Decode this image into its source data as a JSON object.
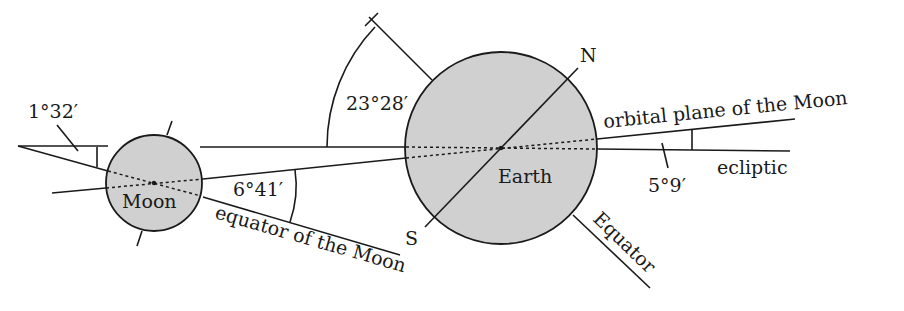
{
  "diagram": {
    "colors": {
      "background": "#ffffff",
      "stroke": "#1a1a1a",
      "body_fill": "#d0d0d0"
    },
    "bodies": {
      "earth": {
        "label": "Earth"
      },
      "moon": {
        "label": "Moon"
      }
    },
    "poles": {
      "north": "N",
      "south": "S"
    },
    "lines": {
      "orbital_plane": "orbital plane of the Moon",
      "ecliptic": "ecliptic",
      "equator_of_moon": "equator of the Moon",
      "earth_equator": "Equator"
    },
    "angles": {
      "earth_obliquity": "23°28′",
      "moon_orbit_inclination": "5°9′",
      "moon_equator_to_ecliptic": "1°32′",
      "moon_equator_to_orbit": "6°41′"
    }
  }
}
